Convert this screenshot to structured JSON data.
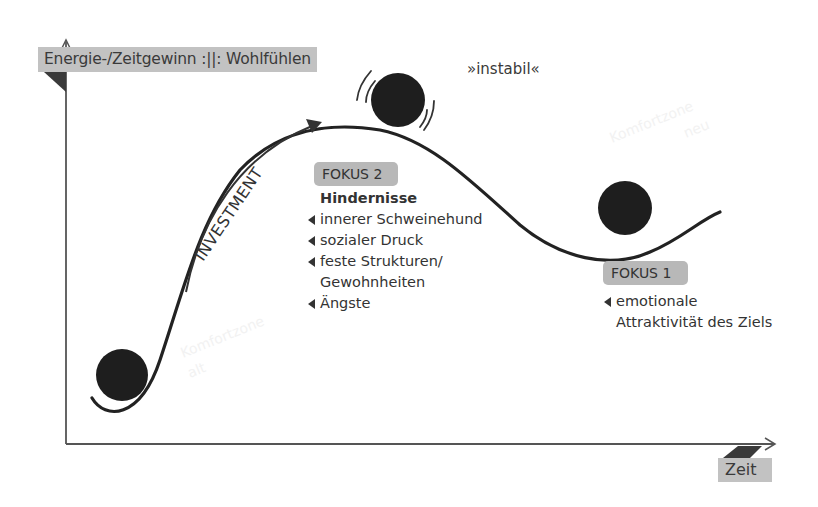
{
  "diagram": {
    "y_axis_label": "Energie-/Zeitgewinn :||: Wohlfühlen",
    "x_axis_label": "Zeit",
    "band": {
      "start_label": [
        "Komfortzone",
        "alt"
      ],
      "end_label": [
        "Komfortzone",
        "neu"
      ]
    },
    "arrow_label": "INVESTMENT",
    "instability_label": "»instabil«",
    "focus2": {
      "tag": "FOKUS 2",
      "heading": "Hindernisse",
      "items": [
        "innerer Schweinehund",
        "sozialer Druck",
        "feste Strukturen/",
        "Gewohnheiten",
        "Ängste"
      ]
    },
    "focus1": {
      "tag": "FOKUS 1",
      "items": [
        "emotionale",
        "Attraktivität des Ziels"
      ]
    },
    "colors": {
      "band_dark": "#6e6e6e",
      "band_light": "#ebebeb",
      "band_mid": "#b0b0b0",
      "ball": "#1e1e1e",
      "curve": "#222222",
      "tag_bg": "#c2c2c2"
    }
  }
}
